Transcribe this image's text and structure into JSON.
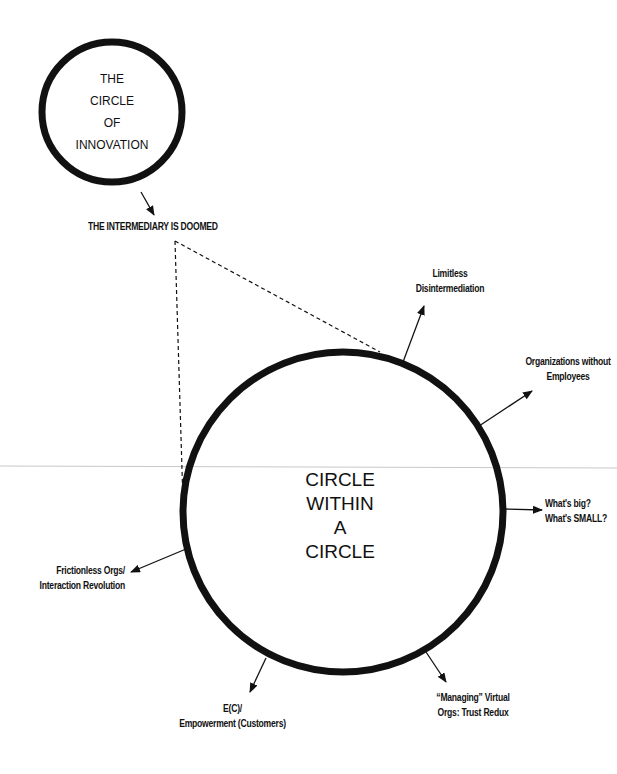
{
  "diagram": {
    "small_circle": {
      "lines": [
        "THE",
        "CIRCLE",
        "OF",
        "INNOVATION"
      ]
    },
    "intermediary_label": "THE INTERMEDIARY IS DOOMED",
    "big_circle": {
      "lines": [
        "CIRCLE",
        "WITHIN",
        "A",
        "CIRCLE"
      ]
    },
    "branches": [
      {
        "id": "limitless",
        "lines": [
          "Limitless",
          "Disintermediation"
        ]
      },
      {
        "id": "orgs-without-employees",
        "lines": [
          "Organizations without",
          "Employees"
        ]
      },
      {
        "id": "big-small",
        "lines": [
          "What's big?",
          "What's SMALL?"
        ]
      },
      {
        "id": "managing-virtual",
        "lines": [
          "“Managing” Virtual",
          "Orgs: Trust Redux"
        ]
      },
      {
        "id": "empowerment",
        "lines": [
          "E(C)/",
          "Empowerment (Customers)"
        ]
      },
      {
        "id": "frictionless",
        "lines": [
          "Frictionless Orgs/",
          "Interaction Revolution"
        ]
      }
    ],
    "colors": {
      "ink": "#111111",
      "divider": "#c8c8c8",
      "background": "#ffffff"
    }
  }
}
